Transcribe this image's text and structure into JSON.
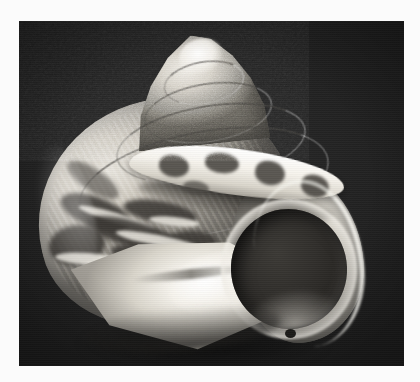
{
  "page": {
    "background_color": "#fbfbfb",
    "width": 420,
    "height": 382
  },
  "photo": {
    "type": "photograph",
    "subject": "marine gastropod shell",
    "common_name": "sea snail shell",
    "view": "apertural view",
    "color_mode": "grayscale",
    "background_color": "#202020",
    "frame": {
      "x": 19,
      "y": 21,
      "width": 385,
      "height": 345
    },
    "alt_text": "Black and white photograph of a turban-shaped sea snail shell seen from the aperture side, resting on a dark background",
    "caption": ""
  },
  "specimen": {
    "parts": [
      {
        "name": "apex",
        "label": "apex"
      },
      {
        "name": "spire",
        "label": "spire"
      },
      {
        "name": "suture",
        "label": "suture"
      },
      {
        "name": "body-whorl",
        "label": "body whorl"
      },
      {
        "name": "shoulder-band",
        "label": "banded shoulder"
      },
      {
        "name": "outer-lip",
        "label": "outer lip"
      },
      {
        "name": "aperture",
        "label": "aperture"
      },
      {
        "name": "columella",
        "label": "columella"
      },
      {
        "name": "siphonal-notch",
        "label": "siphonal notch"
      }
    ],
    "palette": {
      "highlight": "#ffffff",
      "shell_light": "#efece4",
      "shell_mid": "#9e9a92",
      "shell_dark": "#4a4742",
      "aperture_interior": "#302e2b",
      "backdrop": "#202020"
    }
  }
}
